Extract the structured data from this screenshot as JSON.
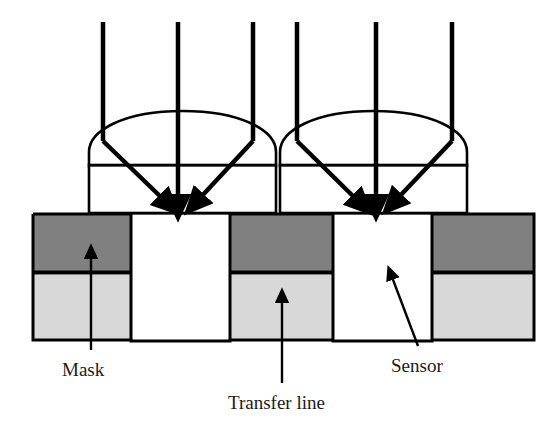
{
  "figure": {
    "background_color": "#ffffff",
    "width": 555,
    "height": 434
  },
  "colors": {
    "stroke": "#000000",
    "mask_dark_band": "#808080",
    "transfer_light_band": "#d8d8d8",
    "sensor_white": "#ffffff",
    "text": "#1a1a1a",
    "lens_fill": "#ffffff"
  },
  "labels": {
    "mask": "Mask",
    "transfer_line": "Transfer line",
    "sensor": "Sensor"
  },
  "lenses": [
    {
      "name": "left-lens",
      "body_left": 89,
      "body_right": 276,
      "body_top": 165,
      "body_bottom": 213,
      "dome_apex_y": 111,
      "dome_flank_y": 165
    },
    {
      "name": "right-lens",
      "body_left": 280,
      "body_right": 467,
      "body_top": 165,
      "body_bottom": 213,
      "dome_apex_y": 111,
      "dome_flank_y": 165
    }
  ],
  "rays": {
    "count": 6,
    "top_y": 22,
    "left_group_x": [
      103,
      178,
      253
    ],
    "right_group_x": [
      297,
      376,
      452
    ],
    "left_group_tips": [
      [
        165,
        203
      ],
      [
        178,
        205
      ],
      [
        205,
        203
      ]
    ],
    "right_group_tips": [
      [
        358,
        203
      ],
      [
        376,
        205
      ],
      [
        400,
        203
      ]
    ],
    "bend_y": 141,
    "description": "Three vertical collimated rays per lens; outer rays refract inward at the dome surface and converge toward the sensor aperture"
  },
  "substrate": {
    "left": 32,
    "right": 535,
    "top": 213,
    "bottom": 341,
    "band_divider_y": 272,
    "dark_band": {
      "top": 213,
      "bottom": 272
    },
    "light_band": {
      "top": 272,
      "bottom": 341
    },
    "apertures": [
      {
        "name": "sensor-aperture-left",
        "left": 131,
        "right": 230,
        "top": 213,
        "bottom": 341
      },
      {
        "name": "sensor-aperture-right",
        "left": 333,
        "right": 432,
        "top": 213,
        "bottom": 341
      }
    ]
  },
  "callouts": [
    {
      "name": "mask-callout",
      "label": "Mask",
      "type": "vertical-arrow",
      "tip": [
        91,
        253
      ],
      "tail": [
        91,
        350
      ],
      "text_x": 62,
      "text_y": 376
    },
    {
      "name": "transfer-line-callout",
      "label": "Transfer line",
      "type": "vertical-arrow",
      "tip": [
        282,
        297
      ],
      "tail": [
        282,
        383
      ],
      "text_x": 228,
      "text_y": 409
    },
    {
      "name": "sensor-callout",
      "label": "Sensor",
      "type": "diagonal-arrow",
      "tip": [
        391,
        274
      ],
      "tail": [
        418,
        346
      ],
      "text_x": 391,
      "text_y": 372
    }
  ]
}
